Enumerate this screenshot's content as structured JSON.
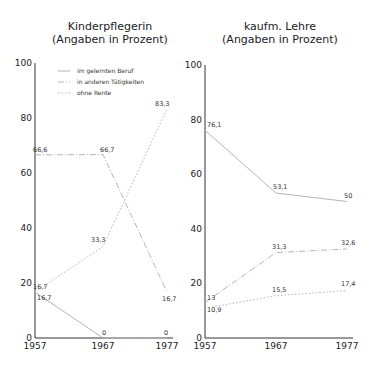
{
  "chart_data": [
    {
      "type": "line",
      "title": "Kinderpflegerin",
      "subtitle": "(Angaben in Prozent)",
      "x": [
        "1957",
        "1967",
        "1977"
      ],
      "xlabel": "",
      "ylabel": "",
      "ylim": [
        0,
        100
      ],
      "yticks": [
        "0",
        "20",
        "40",
        "60",
        "80",
        "100"
      ],
      "grid": false,
      "legend_position": "upper-left inside",
      "series": [
        {
          "name": "im gelernten Beruf",
          "style": "solid",
          "values": [
            16.7,
            0,
            0
          ],
          "labels": [
            "16,7",
            "0",
            "0"
          ]
        },
        {
          "name": "in anderen Tätigkeiten",
          "style": "dash-dot",
          "values": [
            66.6,
            66.7,
            16.7
          ],
          "labels": [
            "66,6",
            "66,7",
            "16,7"
          ]
        },
        {
          "name": "ohne Rente",
          "style": "dotted",
          "values": [
            16.7,
            33.3,
            83.3
          ],
          "labels": [
            "16,7",
            "33,3",
            "83,3"
          ]
        }
      ]
    },
    {
      "type": "line",
      "title": "kaufm. Lehre",
      "subtitle": "(Angaben in Prozent)",
      "x": [
        "1957",
        "1967",
        "1977"
      ],
      "xlabel": "",
      "ylabel": "",
      "ylim": [
        0,
        100
      ],
      "yticks": [
        "0",
        "20",
        "40",
        "60",
        "80",
        "100"
      ],
      "grid": false,
      "series": [
        {
          "name": "im gelernten Beruf",
          "style": "solid",
          "values": [
            76.1,
            53.1,
            50
          ],
          "labels": [
            "76,1",
            "53,1",
            "50"
          ]
        },
        {
          "name": "in anderen Tätigkeiten",
          "style": "dash-dot",
          "values": [
            13,
            31.3,
            32.6
          ],
          "labels": [
            "13",
            "31,3",
            "32,6"
          ]
        },
        {
          "name": "ohne Rente",
          "style": "dotted",
          "values": [
            10.9,
            15.5,
            17.4
          ],
          "labels": [
            "10,9",
            "15,5",
            "17,4"
          ]
        }
      ]
    }
  ],
  "left": {
    "title": "Kinderpflegerin",
    "subtitle": "(Angaben in Prozent)",
    "legend": [
      "im gelernten Beruf",
      "in anderen Tätigkeiten",
      "ohne Rente"
    ]
  },
  "right": {
    "title": "kaufm. Lehre",
    "subtitle": "(Angaben in Prozent)"
  },
  "colors": {
    "axis": "#333333",
    "line": "#b5b5b5",
    "text": "#222222"
  }
}
